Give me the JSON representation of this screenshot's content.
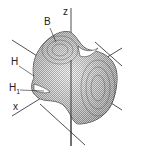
{
  "diagram": {
    "title": "",
    "labels": {
      "B": "B",
      "z": "z",
      "H": "H",
      "H1": "H",
      "H1_sub": "1",
      "x": "x"
    },
    "colors": {
      "ink": "#222222",
      "surface_fill": "#cfcfcf",
      "background": "#ffffff"
    }
  }
}
